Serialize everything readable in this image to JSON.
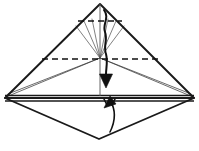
{
  "figure": {
    "background_color": "#ffffff",
    "ink_color": "#1a1a1a",
    "thin_ink_color": "#4a4a4a",
    "width": 199,
    "height": 151
  },
  "geometry": {
    "apex": {
      "x": 100,
      "y": 4
    },
    "center": {
      "x": 100,
      "y": 58
    },
    "left_vertex": {
      "x": 5,
      "y": 98
    },
    "right_vertex": {
      "x": 194,
      "y": 98
    },
    "bottom_vertex": {
      "x": 99,
      "y": 139
    },
    "band_top_y": 95,
    "band_bottom_y": 101
  },
  "shapes": {
    "outer_triangle": {
      "name": "main-triangle",
      "points": "100,4 5,98 194,98"
    },
    "lower_diamond": {
      "name": "lower-diamond",
      "points": "5,98 99,139 194,98"
    },
    "horizontal_band": {
      "name": "horizontal-band",
      "top": "5,96 194,96",
      "bottom": "5,101 194,101"
    },
    "inner_left_edge": "100,58 6,97",
    "inner_right_edge": "100,58 193,97",
    "inner_left_upper": "100,58 8,95",
    "inner_right_upper": "100,58 191,95"
  },
  "creases": {
    "upper_dashed": {
      "name": "upper-valley-crease",
      "from": {
        "x": 78,
        "y": 21
      },
      "to": {
        "x": 122,
        "y": 21
      }
    },
    "main_dashed": {
      "name": "main-valley-crease",
      "from": {
        "x": 42,
        "y": 59
      },
      "to": {
        "x": 158,
        "y": 59
      }
    },
    "fan_lines": [
      {
        "name": "fan-line-1",
        "to_x": 76,
        "to_y": 26
      },
      {
        "name": "fan-line-2",
        "to_x": 84,
        "to_y": 21
      },
      {
        "name": "fan-line-3",
        "to_x": 92,
        "to_y": 19
      },
      {
        "name": "fan-line-4",
        "to_x": 108,
        "to_y": 19
      },
      {
        "name": "fan-line-5",
        "to_x": 116,
        "to_y": 21
      },
      {
        "name": "fan-line-6",
        "to_x": 124,
        "to_y": 26
      }
    ],
    "vertical_axis": {
      "name": "center-axis",
      "from": {
        "x": 100,
        "y": 4
      },
      "to": {
        "x": 100,
        "y": 96
      }
    }
  },
  "arrows": {
    "fold_down": {
      "name": "fold-down-arrow",
      "label": "fold top point down",
      "direction": "down",
      "path": "M 104,10 C 110,18 102,24 105,32 C 108,40 103,46 106,54 C 108,62 106,68 106,74",
      "head": "99.5,74 112.5,74 106,88",
      "color": "#111111"
    },
    "fold_up": {
      "name": "fold-up-arrow",
      "label": "fold bottom point up",
      "direction": "up",
      "path": "M 110,132 C 116,120 116,110 110,100",
      "head": "104,108 116,104 110,96",
      "tail_ticks": "M 107,105 L 104,99 M 112,105 L 115,99",
      "color": "#111111"
    }
  }
}
